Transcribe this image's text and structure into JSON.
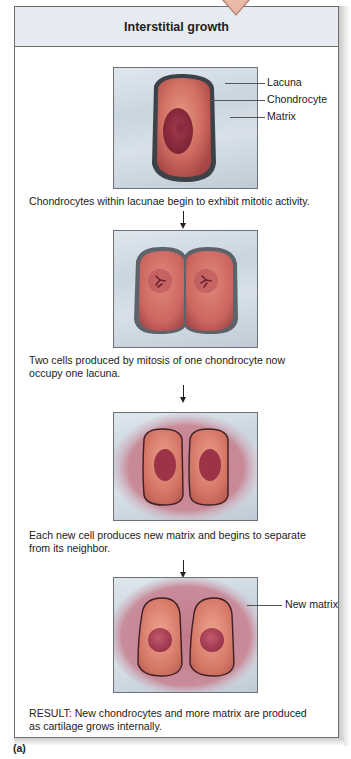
{
  "panel": {
    "title": "Interstitial growth"
  },
  "steps": [
    {
      "caption": "Chondrocytes within lacunae begin to exhibit mitotic activity.",
      "labels": [
        "Lacuna",
        "Chondrocyte",
        "Matrix"
      ]
    },
    {
      "caption_line1": "Two cells produced by mitosis of one chondrocyte now",
      "caption_line2": "occupy one lacuna."
    },
    {
      "caption_line1": "Each new cell produces new matrix and begins to separate",
      "caption_line2": "from its neighbor."
    },
    {
      "caption_line1": "RESULT: New chondrocytes and more matrix are produced",
      "caption_line2": "as cartilage grows internally.",
      "labels": [
        "New matrix"
      ]
    }
  ],
  "figure_label": "(a)",
  "colors": {
    "header_bg": "#e6ebf1",
    "cell": "#c9645c",
    "nucleus": "#8e2a3a",
    "matrix_bg": "#cfd9e2",
    "new_matrix": "#c78a98"
  }
}
